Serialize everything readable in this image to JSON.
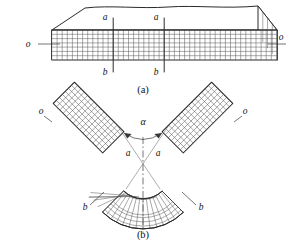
{
  "figure": {
    "colors": {
      "outline": "#2a2a2a",
      "grid": "#555555",
      "background": "#ffffff",
      "label": "#111111"
    },
    "panels": [
      {
        "id": "a",
        "caption": "(a)",
        "description": "Straight prismatic beam in isometric view with rectangular longitudinal grid on the front face",
        "labels": {
          "left_end": "o",
          "right_end": "o",
          "top_marks": [
            "a",
            "a"
          ],
          "bottom_marks": [
            "b",
            "b"
          ]
        },
        "grid": {
          "columns": 44,
          "rows": 7
        }
      },
      {
        "id": "b",
        "caption": "(b)",
        "description": "Same beam after bending into a V shape; grid lines become radial rays and concentric arcs",
        "labels": {
          "left_end": "o",
          "right_end": "o",
          "angle": "α",
          "apex_left": "a",
          "apex_right": "a",
          "outer_left": "b",
          "outer_right": "b"
        },
        "grid": {
          "radial_divisions": 22,
          "arc_layers": 7
        }
      }
    ]
  }
}
